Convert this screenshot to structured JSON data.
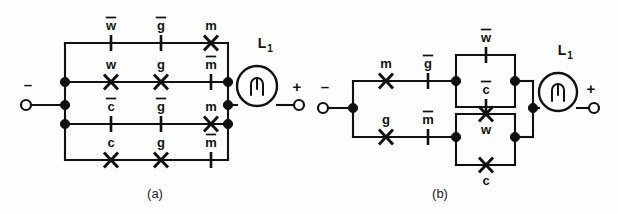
{
  "figure": {
    "kind": "relay-ladder-circuit-pair",
    "panels": [
      {
        "id": "a",
        "caption": "(a)",
        "caption_x": 155,
        "caption_y": 198,
        "terminal_left": {
          "sign": "–",
          "sign_x": 28,
          "sign_y": 90,
          "cx": 26,
          "cy": 105,
          "r": 5
        },
        "terminal_right": {
          "sign": "+",
          "sign_x": 297,
          "sign_y": 92,
          "cx": 299,
          "cy": 105,
          "r": 5
        },
        "lamp": {
          "name": "L",
          "subscript": "1",
          "cx": 257,
          "cy": 86,
          "r": 20,
          "label_x": 262,
          "label_y": 48
        },
        "rows": [
          {
            "y": 43,
            "name": "row-top",
            "contacts": [
              {
                "x": 111,
                "type": "break",
                "label": "w",
                "bar": true,
                "label_pos": "above"
              },
              {
                "x": 161,
                "type": "break",
                "label": "g",
                "bar": true,
                "label_pos": "above"
              },
              {
                "x": 211,
                "type": "make",
                "label": "m",
                "bar": false,
                "label_pos": "above"
              }
            ]
          },
          {
            "y": 82,
            "name": "row-two",
            "contacts": [
              {
                "x": 111,
                "type": "make",
                "label": "w",
                "bar": false,
                "label_pos": "above"
              },
              {
                "x": 161,
                "type": "make",
                "label": "g",
                "bar": false,
                "label_pos": "above"
              },
              {
                "x": 211,
                "type": "break",
                "label": "m",
                "bar": true,
                "label_pos": "above"
              }
            ]
          },
          {
            "y": 124,
            "name": "row-three",
            "contacts": [
              {
                "x": 111,
                "type": "break",
                "label": "c",
                "bar": true,
                "label_pos": "above"
              },
              {
                "x": 161,
                "type": "break",
                "label": "g",
                "bar": true,
                "label_pos": "above"
              },
              {
                "x": 211,
                "type": "make",
                "label": "m",
                "bar": false,
                "label_pos": "above"
              }
            ]
          },
          {
            "y": 160,
            "name": "row-bottom",
            "contacts": [
              {
                "x": 111,
                "type": "make",
                "label": "c",
                "bar": false,
                "label_pos": "above"
              },
              {
                "x": 161,
                "type": "make",
                "label": "g",
                "bar": false,
                "label_pos": "above"
              },
              {
                "x": 211,
                "type": "break",
                "label": "m",
                "bar": true,
                "label_pos": "above"
              }
            ]
          }
        ],
        "bus_left_x": 65,
        "bus_right_x": 228,
        "junctions_left": [
          82,
          105,
          124
        ],
        "junctions_right": [
          82,
          105,
          124
        ]
      },
      {
        "id": "b",
        "caption": "(b)",
        "caption_x": 440,
        "caption_y": 198,
        "terminal_left": {
          "sign": "–",
          "sign_x": 325,
          "sign_y": 92,
          "cx": 323,
          "cy": 108,
          "r": 5
        },
        "terminal_right": {
          "sign": "+",
          "sign_x": 591,
          "sign_y": 94,
          "cx": 594,
          "cy": 108,
          "r": 5
        },
        "lamp": {
          "name": "L",
          "subscript": "1",
          "cx": 558,
          "cy": 92,
          "r": 19,
          "label_x": 562,
          "label_y": 55
        },
        "branches": [
          {
            "y": 81,
            "name": "branch-upper",
            "contacts": [
              {
                "x": 386,
                "type": "make",
                "label": "m",
                "bar": false,
                "label_pos": "above"
              },
              {
                "x": 428,
                "type": "break",
                "label": "g",
                "bar": true,
                "label_pos": "above"
              }
            ]
          },
          {
            "y": 137,
            "name": "branch-lower",
            "contacts": [
              {
                "x": 386,
                "type": "make",
                "label": "g",
                "bar": false,
                "label_pos": "above"
              },
              {
                "x": 428,
                "type": "break",
                "label": "m",
                "bar": true,
                "label_pos": "above"
              }
            ]
          }
        ],
        "bridges": [
          {
            "name": "bridge-upper",
            "left_x": 456,
            "right_x": 515,
            "in_y": 81,
            "top_y": 55,
            "bottom_y": 107,
            "contacts": [
              {
                "x": 486,
                "y": 55,
                "type": "break",
                "label": "w",
                "bar": true,
                "label_pos": "above"
              },
              {
                "x": 486,
                "y": 107,
                "type": "break",
                "label": "c",
                "bar": true,
                "label_pos": "above"
              }
            ]
          },
          {
            "name": "bridge-lower",
            "left_x": 456,
            "right_x": 515,
            "in_y": 137,
            "top_y": 114,
            "bottom_y": 165,
            "contacts": [
              {
                "x": 486,
                "y": 114,
                "type": "make",
                "label": "w",
                "bar": false,
                "label_pos": "below"
              },
              {
                "x": 486,
                "y": 165,
                "type": "make",
                "label": "c",
                "bar": false,
                "label_pos": "below"
              }
            ]
          }
        ],
        "bus_left_x": 353,
        "output_x": 533,
        "output_y": 108
      }
    ]
  }
}
